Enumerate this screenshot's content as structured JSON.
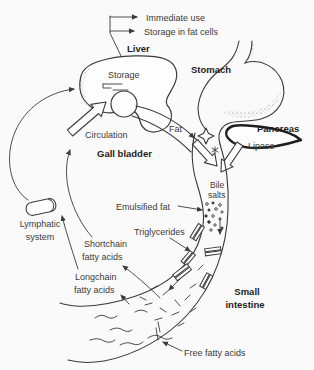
{
  "figure": {
    "title_hint": "Fat digestion pathway diagram",
    "colors": {
      "ink": "#3a3a3a",
      "paper": "#fbfafa",
      "text": "#2e2e2e"
    },
    "labels": {
      "immediate_use": "Immediate use",
      "storage_fat_cells": "Storage in fat cells",
      "liver": "Liver",
      "storage": "Storage",
      "stomach": "Stomach",
      "circulation": "Circulation",
      "gall_bladder": "Gall bladder",
      "fat": "Fat",
      "pancreas": "Pancreas",
      "lipase": "Lipase",
      "bile_salts": [
        "Bile",
        "salts"
      ],
      "emulsified_fat": "Emulsified fat",
      "triglycerides": "Triglycerides",
      "lymphatic_system": [
        "Lymphatic",
        "system"
      ],
      "shortchain_fatty_acids": [
        "Shortchain",
        "fatty acids"
      ],
      "longchain_fatty_acids": [
        "Longchain",
        "fatty acids"
      ],
      "small_intestine": [
        "Small",
        "intestine"
      ],
      "free_fatty_acids": "Free fatty acids"
    }
  }
}
